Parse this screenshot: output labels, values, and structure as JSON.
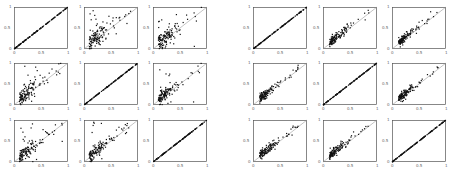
{
  "figure": {
    "groups": [
      {
        "name": "left-group",
        "x0": 14,
        "colStep": 69.5,
        "rowY": [
          7,
          63,
          120
        ]
      },
      {
        "name": "right-group",
        "x0": 253,
        "colStep": 69.5,
        "rowY": [
          7,
          63,
          120
        ]
      }
    ],
    "tick_labels": {
      "x": [
        "0",
        "0.5",
        "1"
      ],
      "y": [
        "0",
        "0.5",
        "1"
      ]
    }
  },
  "chart_data": [
    {
      "type": "scatter",
      "group": "left",
      "row": 1,
      "col": 1,
      "pattern": "diagonal",
      "spread": 0.0,
      "xlim": [
        0,
        1
      ],
      "ylim": [
        0,
        1
      ],
      "reference_line": "y=x"
    },
    {
      "type": "scatter",
      "group": "left",
      "row": 1,
      "col": 2,
      "pattern": "cloud",
      "spread": 0.18,
      "xlim": [
        0,
        1
      ],
      "ylim": [
        0,
        1
      ],
      "reference_line": "y=x"
    },
    {
      "type": "scatter",
      "group": "left",
      "row": 1,
      "col": 3,
      "pattern": "cloud",
      "spread": 0.16,
      "xlim": [
        0,
        1
      ],
      "ylim": [
        0,
        1
      ],
      "reference_line": "y=x"
    },
    {
      "type": "scatter",
      "group": "left",
      "row": 2,
      "col": 1,
      "pattern": "cloud",
      "spread": 0.18,
      "xlim": [
        0,
        1
      ],
      "ylim": [
        0,
        1
      ],
      "reference_line": "y=x"
    },
    {
      "type": "scatter",
      "group": "left",
      "row": 2,
      "col": 2,
      "pattern": "diagonal",
      "spread": 0.0,
      "xlim": [
        0,
        1
      ],
      "ylim": [
        0,
        1
      ],
      "reference_line": "y=x"
    },
    {
      "type": "scatter",
      "group": "left",
      "row": 2,
      "col": 3,
      "pattern": "cloud",
      "spread": 0.13,
      "xlim": [
        0,
        1
      ],
      "ylim": [
        0,
        1
      ],
      "reference_line": "y=x"
    },
    {
      "type": "scatter",
      "group": "left",
      "row": 3,
      "col": 1,
      "pattern": "cloud",
      "spread": 0.15,
      "xlim": [
        0,
        1
      ],
      "ylim": [
        0,
        1
      ],
      "reference_line": "y=x"
    },
    {
      "type": "scatter",
      "group": "left",
      "row": 3,
      "col": 2,
      "pattern": "cloud",
      "spread": 0.12,
      "xlim": [
        0,
        1
      ],
      "ylim": [
        0,
        1
      ],
      "reference_line": "y=x"
    },
    {
      "type": "scatter",
      "group": "left",
      "row": 3,
      "col": 3,
      "pattern": "diagonal",
      "spread": 0.0,
      "xlim": [
        0,
        1
      ],
      "ylim": [
        0,
        1
      ],
      "reference_line": "y=x"
    },
    {
      "type": "scatter",
      "group": "right",
      "row": 1,
      "col": 1,
      "pattern": "diagonal",
      "spread": 0.0,
      "xlim": [
        0,
        1
      ],
      "ylim": [
        0,
        1
      ],
      "reference_line": "y=x"
    },
    {
      "type": "scatter",
      "group": "right",
      "row": 1,
      "col": 2,
      "pattern": "tight",
      "spread": 0.05,
      "xlim": [
        0,
        1
      ],
      "ylim": [
        0,
        1
      ],
      "reference_line": "y=x"
    },
    {
      "type": "scatter",
      "group": "right",
      "row": 1,
      "col": 3,
      "pattern": "tight",
      "spread": 0.05,
      "xlim": [
        0,
        1
      ],
      "ylim": [
        0,
        1
      ],
      "reference_line": "y=x"
    },
    {
      "type": "scatter",
      "group": "right",
      "row": 2,
      "col": 1,
      "pattern": "tight",
      "spread": 0.05,
      "xlim": [
        0,
        1
      ],
      "ylim": [
        0,
        1
      ],
      "reference_line": "y=x"
    },
    {
      "type": "scatter",
      "group": "right",
      "row": 2,
      "col": 2,
      "pattern": "diagonal",
      "spread": 0.0,
      "xlim": [
        0,
        1
      ],
      "ylim": [
        0,
        1
      ],
      "reference_line": "y=x"
    },
    {
      "type": "scatter",
      "group": "right",
      "row": 2,
      "col": 3,
      "pattern": "tight",
      "spread": 0.05,
      "xlim": [
        0,
        1
      ],
      "ylim": [
        0,
        1
      ],
      "reference_line": "y=x"
    },
    {
      "type": "scatter",
      "group": "right",
      "row": 3,
      "col": 1,
      "pattern": "tight",
      "spread": 0.05,
      "xlim": [
        0,
        1
      ],
      "ylim": [
        0,
        1
      ],
      "reference_line": "y=x"
    },
    {
      "type": "scatter",
      "group": "right",
      "row": 3,
      "col": 2,
      "pattern": "tight",
      "spread": 0.05,
      "xlim": [
        0,
        1
      ],
      "ylim": [
        0,
        1
      ],
      "reference_line": "y=x"
    },
    {
      "type": "scatter",
      "group": "right",
      "row": 3,
      "col": 3,
      "pattern": "diagonal",
      "spread": 0.0,
      "xlim": [
        0,
        1
      ],
      "ylim": [
        0,
        1
      ],
      "reference_line": "y=x"
    }
  ]
}
